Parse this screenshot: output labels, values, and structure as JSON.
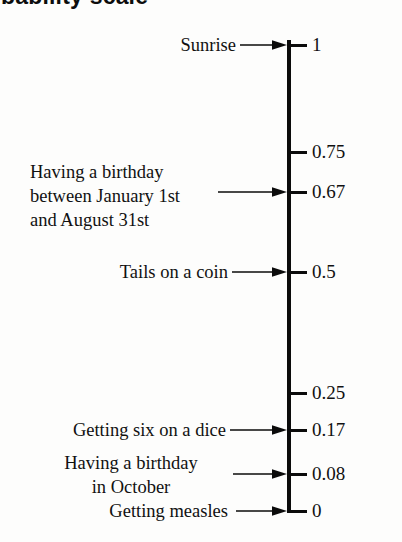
{
  "title": {
    "text": "Probability scale",
    "visible_fragment": "obability scale",
    "clipped": true
  },
  "scale": {
    "orientation": "vertical",
    "top_value": "1",
    "bottom_value": "0",
    "ticks": [
      {
        "label": "1",
        "value": 1,
        "y": 45
      },
      {
        "label": "0.75",
        "value": 0.75,
        "y": 152
      },
      {
        "label": "0.67",
        "value": 0.67,
        "y": 192
      },
      {
        "label": "0.5",
        "value": 0.5,
        "y": 272
      },
      {
        "label": "0.25",
        "value": 0.25,
        "y": 393
      },
      {
        "label": "0.17",
        "value": 0.17,
        "y": 430
      },
      {
        "label": "0.08",
        "value": 0.08,
        "y": 474
      },
      {
        "label": "0",
        "value": 0,
        "y": 511
      }
    ]
  },
  "events": [
    {
      "name": "sunrise",
      "text": "Sunrise",
      "probability": "1",
      "align": "right",
      "text_left": 40,
      "text_width": 196,
      "text_top": 33,
      "arrow_left": 240,
      "arrow_right": 287,
      "arrow_y": 45
    },
    {
      "name": "birthday-january-to-august",
      "text": "Having a birthday\nbetween January 1st\nand August 31st",
      "probability": "0.67",
      "align": "left",
      "text_left": 30,
      "text_width": 210,
      "text_top": 160,
      "arrow_left": 218,
      "arrow_right": 287,
      "arrow_y": 192
    },
    {
      "name": "tails-on-a-coin",
      "text": "Tails on a coin",
      "probability": "0.5",
      "align": "right",
      "text_left": 60,
      "text_width": 168,
      "text_top": 260,
      "arrow_left": 232,
      "arrow_right": 287,
      "arrow_y": 272
    },
    {
      "name": "getting-six-on-a-dice",
      "text": "Getting six on a dice",
      "probability": "0.17",
      "align": "right",
      "text_left": 20,
      "text_width": 206,
      "text_top": 418,
      "arrow_left": 230,
      "arrow_right": 287,
      "arrow_y": 430
    },
    {
      "name": "birthday-in-october",
      "text": "Having a birthday\nin October",
      "probability": "0.08",
      "align": "center",
      "text_left": 36,
      "text_width": 190,
      "text_top": 451,
      "arrow_left": 233,
      "arrow_right": 287,
      "arrow_y": 474
    },
    {
      "name": "getting-measles",
      "text": "Getting measles",
      "probability": "0",
      "align": "right",
      "text_left": 60,
      "text_width": 168,
      "text_top": 499,
      "arrow_left": 236,
      "arrow_right": 287,
      "arrow_y": 511
    }
  ],
  "colors": {
    "ink": "#0b0b0b",
    "text": "#111111",
    "background": "#fdfdfc"
  }
}
